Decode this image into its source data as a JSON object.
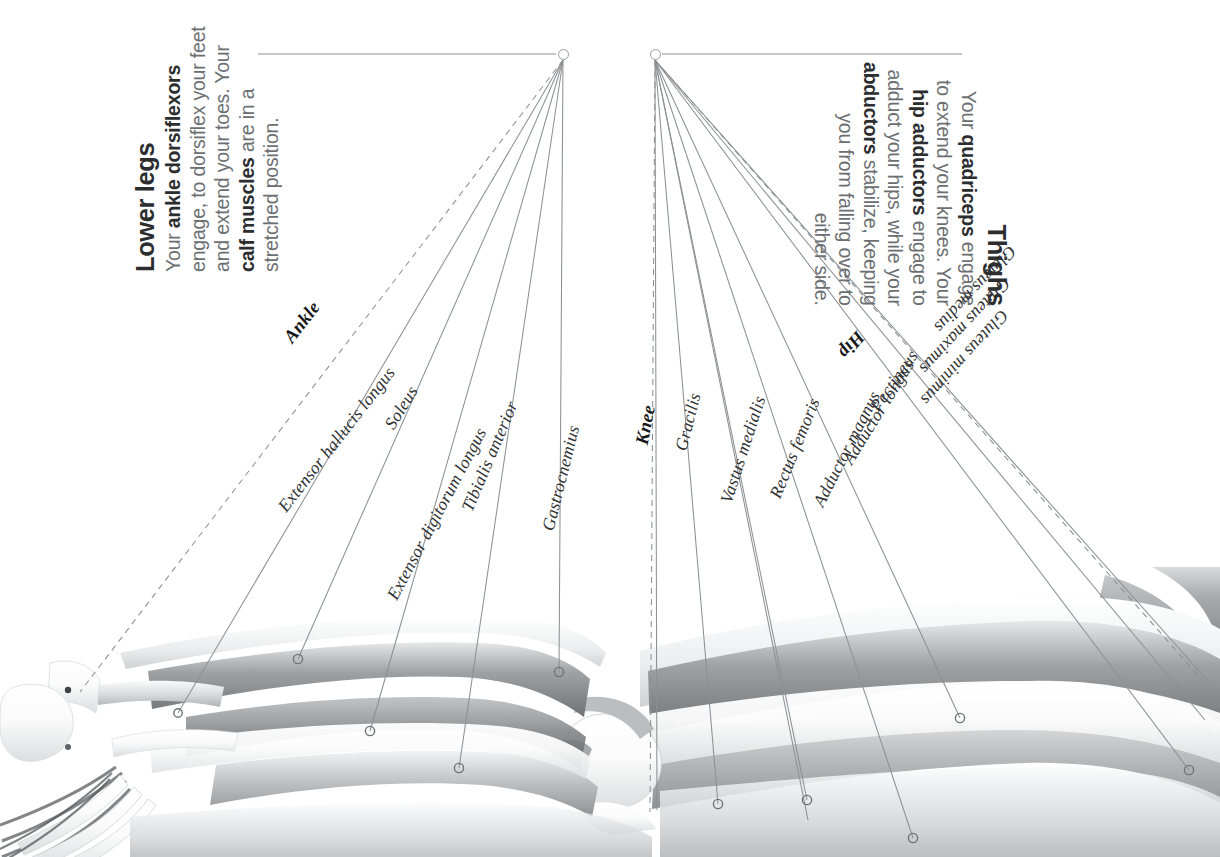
{
  "figure": {
    "title_left": "Lower legs",
    "title_right": "Thighs",
    "background": "#ffffff",
    "ink": "#2b2d2f",
    "muted": "#6c6f72",
    "leader": "#8d9093"
  },
  "left_panel": {
    "heading": "Lower legs",
    "body_lines": [
      "Your <b>ankle dorsiflexors</b>",
      "engage, to dorsiflex your feet",
      "and extend your toes. Your",
      "<b>calf muscles</b> are in a",
      "stretched position."
    ],
    "body_plain": "Your ankle dorsiflexors engage, to dorsiflex your feet and extend your toes. Your calf muscles are in a stretched position."
  },
  "right_panel": {
    "heading": "Thighs",
    "body_lines": [
      "Your <b>quadriceps</b> engage",
      "to extend your knees. Your",
      "<b>hip adductors</b> engage to",
      "adduct your hips, while your",
      "<b>abductors</b> stabilize, keeping",
      "you from falling over to",
      "either side."
    ],
    "body_plain": "Your quadriceps engage to extend your knees. Your hip adductors engage to adduct your hips, while your abductors stabilize, keeping you from falling over to either side."
  },
  "joints": [
    {
      "name": "Ankle",
      "style": "dashed",
      "side": "left"
    },
    {
      "name": "Knee",
      "style": "dashed",
      "side": "right"
    },
    {
      "name": "Hip",
      "style": "dashed",
      "side": "right"
    }
  ],
  "labels_left": [
    {
      "name": "Ankle",
      "joint": true,
      "x": 288,
      "y": 330,
      "rot": -52,
      "dashed": true,
      "tx": 80,
      "ty": 692
    },
    {
      "name": "Extensor hallucis longus",
      "joint": false,
      "x": 282,
      "y": 499,
      "rot": -52,
      "dashed": false,
      "tx": 178,
      "ty": 713
    },
    {
      "name": "Soleus",
      "joint": false,
      "x": 389,
      "y": 417,
      "rot": -58,
      "dashed": false,
      "tx": 298,
      "ty": 659
    },
    {
      "name": "Extensor digitorum longus",
      "joint": false,
      "x": 392,
      "y": 588,
      "rot": -62,
      "dashed": false,
      "tx": 370,
      "ty": 731
    },
    {
      "name": "Tibialis anterior",
      "joint": false,
      "x": 467,
      "y": 500,
      "rot": -67,
      "dashed": false,
      "tx": 459,
      "ty": 768
    },
    {
      "name": "Gastrocnemius",
      "joint": false,
      "x": 548,
      "y": 520,
      "rot": -76,
      "dashed": false,
      "tx": 559,
      "ty": 672
    }
  ],
  "labels_right": [
    {
      "name": "Knee",
      "joint": true,
      "x": 642,
      "y": 434,
      "rot": -79,
      "dashed": true,
      "tx": 650,
      "ty": 812
    },
    {
      "name": "Gracilis",
      "joint": false,
      "x": 681,
      "y": 440,
      "rot": -76,
      "dashed": false,
      "tx": 657,
      "ty": 810
    },
    {
      "name": "Vastus medialis",
      "joint": false,
      "x": 726,
      "y": 492,
      "rot": -72,
      "dashed": false,
      "tx": 718,
      "ty": 804
    },
    {
      "name": "Rectus femoris",
      "joint": false,
      "x": 775,
      "y": 487,
      "rot": -68,
      "dashed": false,
      "tx": 807,
      "ty": 800
    },
    {
      "name": "Adductor magnus",
      "joint": false,
      "x": 818,
      "y": 495,
      "rot": -63,
      "dashed": false,
      "tx": 808,
      "ty": 820
    },
    {
      "name": "Adductor longus",
      "joint": false,
      "x": 847,
      "y": 452,
      "rot": -58,
      "dashed": false,
      "tx": 913,
      "ty": 838
    },
    {
      "name": "Pectineus",
      "joint": false,
      "x": 874,
      "y": 399,
      "rot": -55,
      "dashed": false,
      "tx": 960,
      "ty": 718
    },
    {
      "name": "Hip",
      "joint": true,
      "x": 861,
      "y": 323,
      "rot": 131,
      "dashed": true,
      "tx": 1203,
      "ty": 681
    },
    {
      "name": "Gluteus minimus",
      "joint": false,
      "x": 1005,
      "y": 302,
      "rot": 132,
      "dashed": false,
      "tx": 1189,
      "ty": 770
    },
    {
      "name": "Gluteus maximus",
      "joint": false,
      "x": 1007,
      "y": 270,
      "rot": 133,
      "dashed": false,
      "tx": 1205,
      "ty": 720
    },
    {
      "name": "Gluteus medius",
      "joint": false,
      "x": 1013,
      "y": 238,
      "rot": 133,
      "dashed": false,
      "tx": 1216,
      "ty": 690
    }
  ],
  "anchors": {
    "left": {
      "x": 563,
      "y": 54,
      "rule_from": 258,
      "rule_to": 556
    },
    "right": {
      "x": 655,
      "y": 54,
      "rule_from": 662,
      "rule_to": 962
    }
  },
  "illustration": {
    "alt": "lateral view of a leg showing bones and muscles in greyscale",
    "parts": [
      "foot",
      "ankle",
      "calf",
      "knee",
      "thigh",
      "hip"
    ]
  }
}
